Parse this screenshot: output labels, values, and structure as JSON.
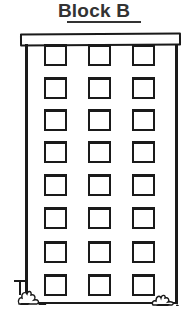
{
  "title": "Block B",
  "building": {
    "columns": 3,
    "rows": 8,
    "window_columns_x": [
      44,
      88,
      132
    ],
    "window_rows_y": [
      44,
      77,
      109,
      141,
      174,
      207,
      241,
      274
    ]
  },
  "icons": [
    "building-illustration",
    "bush-left",
    "bush-right"
  ]
}
